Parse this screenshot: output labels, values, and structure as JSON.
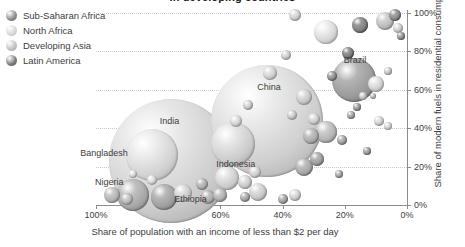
{
  "title": "in developing countries",
  "legend": {
    "position": "top-left",
    "items": [
      {
        "label": "Sub-Saharan Africa",
        "color": "#8d8d8d",
        "icon": "bubble-icon"
      },
      {
        "label": "North Africa",
        "color": "#d8d8d8",
        "icon": "bubble-icon"
      },
      {
        "label": "Developing Asia",
        "color": "#c2c2c2",
        "icon": "bubble-icon"
      },
      {
        "label": "Latin America",
        "color": "#7a7a7a",
        "icon": "bubble-icon"
      }
    ]
  },
  "axes": {
    "x": {
      "label": "Share of population with an income of less than $2 per day",
      "ticks": [
        "100%",
        "80%",
        "60%",
        "40%",
        "20%",
        "0%"
      ],
      "values": [
        100,
        80,
        60,
        40,
        20,
        0
      ],
      "reversed": true
    },
    "y": {
      "label": "Share of modern fuels in residential consumption",
      "ticks": [
        "0%",
        "20%",
        "40%",
        "60%",
        "80%",
        "100%"
      ],
      "values": [
        0,
        20,
        40,
        60,
        80,
        100
      ],
      "side": "right"
    }
  },
  "chart_data": {
    "type": "scatter",
    "title": "in developing countries",
    "xlabel": "Share of population with an income of less than $2 per day",
    "ylabel": "Share of modern fuels in residential consumption",
    "xlim": [
      100,
      0
    ],
    "ylim": [
      0,
      100
    ],
    "x_reversed": true,
    "grid": true,
    "legend_position": "top-left",
    "bubble_encoding": "population",
    "series": [
      {
        "name": "Sub-Saharan Africa",
        "color": "#8d8d8d"
      },
      {
        "name": "North Africa",
        "color": "#d8d8d8"
      },
      {
        "name": "Developing Asia",
        "color": "#c2c2c2"
      },
      {
        "name": "Latin America",
        "color": "#7a7a7a"
      }
    ],
    "points": [
      {
        "label": "India",
        "x": 76,
        "y": 23,
        "size": 62,
        "group": "Developing Asia",
        "color": "#cccccc",
        "label_dx": -1,
        "label_dy": -40
      },
      {
        "label": "Bangladesh",
        "x": 82,
        "y": 26,
        "size": 26,
        "group": "Developing Asia",
        "color": "#d2d2d2",
        "label_dx": -48,
        "label_dy": -2
      },
      {
        "label": "China",
        "x": 45,
        "y": 44,
        "size": 56,
        "group": "Developing Asia",
        "color": "#cfcfcf",
        "label_dx": 2,
        "label_dy": -34
      },
      {
        "label": "Brazil",
        "x": 17,
        "y": 65,
        "size": 22,
        "group": "Latin America",
        "color": "#9a9a9a",
        "label_dx": 1,
        "label_dy": -20
      },
      {
        "label": "Indonesia",
        "x": 56,
        "y": 32,
        "size": 22,
        "group": "Developing Asia",
        "color": "#cbcbcb",
        "label_dx": 3,
        "label_dy": 20
      },
      {
        "label": "Nigeria",
        "x": 88,
        "y": 5,
        "size": 16,
        "group": "Sub-Saharan Africa",
        "color": "#a6a6a6",
        "label_dx": -24,
        "label_dy": -13
      },
      {
        "label": "Ethiopia",
        "x": 78,
        "y": 4,
        "size": 13,
        "group": "Sub-Saharan Africa",
        "color": "#9e9e9e",
        "label_dx": 26,
        "label_dy": 2
      },
      {
        "label": "",
        "x": 95,
        "y": 5,
        "size": 8,
        "group": "Sub-Saharan Africa",
        "color": "#b0b0b0"
      },
      {
        "label": "",
        "x": 90,
        "y": 3,
        "size": 6,
        "group": "Sub-Saharan Africa",
        "color": "#b4b4b4"
      },
      {
        "label": "",
        "x": 72,
        "y": 6,
        "size": 9,
        "group": "Developing Asia",
        "color": "#c6c6c6"
      },
      {
        "label": "",
        "x": 64,
        "y": 4,
        "size": 7,
        "group": "Sub-Saharan Africa",
        "color": "#a8a8a8"
      },
      {
        "label": "",
        "x": 60,
        "y": 5,
        "size": 7,
        "group": "Sub-Saharan Africa",
        "color": "#adadad"
      },
      {
        "label": "",
        "x": 52,
        "y": 4,
        "size": 5,
        "group": "Sub-Saharan Africa",
        "color": "#a3a3a3"
      },
      {
        "label": "",
        "x": 48,
        "y": 7,
        "size": 9,
        "group": "Developing Asia",
        "color": "#c4c4c4"
      },
      {
        "label": "",
        "x": 40,
        "y": 3,
        "size": 5,
        "group": "Sub-Saharan Africa",
        "color": "#a0a0a0"
      },
      {
        "label": "",
        "x": 36,
        "y": 5,
        "size": 6,
        "group": "Developing Asia",
        "color": "#c8c8c8"
      },
      {
        "label": "",
        "x": 58,
        "y": 14,
        "size": 12,
        "group": "Developing Asia",
        "color": "#cacaca"
      },
      {
        "label": "",
        "x": 52,
        "y": 12,
        "size": 7,
        "group": "Developing Asia",
        "color": "#c5c5c5"
      },
      {
        "label": "",
        "x": 66,
        "y": 11,
        "size": 6,
        "group": "Sub-Saharan Africa",
        "color": "#aaaaaa"
      },
      {
        "label": "",
        "x": 33,
        "y": 20,
        "size": 9,
        "group": "Latin America",
        "color": "#a5a5a5"
      },
      {
        "label": "",
        "x": 29,
        "y": 24,
        "size": 7,
        "group": "Latin America",
        "color": "#9c9c9c"
      },
      {
        "label": "",
        "x": 26,
        "y": 38,
        "size": 11,
        "group": "Latin America",
        "color": "#b3b3b3"
      },
      {
        "label": "",
        "x": 31,
        "y": 36,
        "size": 8,
        "group": "Latin America",
        "color": "#a9a9a9"
      },
      {
        "label": "",
        "x": 21,
        "y": 34,
        "size": 5,
        "group": "Latin America",
        "color": "#9f9f9f"
      },
      {
        "label": "",
        "x": 18,
        "y": 47,
        "size": 4,
        "group": "Latin America",
        "color": "#a1a1a1"
      },
      {
        "label": "",
        "x": 16,
        "y": 51,
        "size": 4,
        "group": "Latin America",
        "color": "#999999"
      },
      {
        "label": "",
        "x": 14,
        "y": 57,
        "size": 4,
        "group": "North Africa",
        "color": "#c0c0c0"
      },
      {
        "label": "",
        "x": 11,
        "y": 57,
        "size": 3,
        "group": "North Africa",
        "color": "#bdbdbd"
      },
      {
        "label": "",
        "x": 10,
        "y": 63,
        "size": 8,
        "group": "North Africa",
        "color": "#cdcdcd"
      },
      {
        "label": "",
        "x": 33,
        "y": 56,
        "size": 8,
        "group": "Developing Asia",
        "color": "#c3c3c3"
      },
      {
        "label": "",
        "x": 24,
        "y": 67,
        "size": 5,
        "group": "Latin America",
        "color": "#8f8f8f"
      },
      {
        "label": "",
        "x": 19,
        "y": 79,
        "size": 6,
        "group": "Latin America",
        "color": "#7d7d7d"
      },
      {
        "label": "",
        "x": 26,
        "y": 90,
        "size": 12,
        "group": "North Africa",
        "color": "#d4d4d4"
      },
      {
        "label": "",
        "x": 15,
        "y": 94,
        "size": 8,
        "group": "Latin America",
        "color": "#7f7f7f"
      },
      {
        "label": "",
        "x": 7,
        "y": 96,
        "size": 9,
        "group": "North Africa",
        "color": "#b8b8b8"
      },
      {
        "label": "",
        "x": 4,
        "y": 99,
        "size": 6,
        "group": "Latin America",
        "color": "#8a8a8a"
      },
      {
        "label": "",
        "x": 3,
        "y": 92,
        "size": 5,
        "group": "North Africa",
        "color": "#c7c7c7"
      },
      {
        "label": "",
        "x": 2,
        "y": 88,
        "size": 4,
        "group": "Latin America",
        "color": "#959595"
      },
      {
        "label": "",
        "x": 6,
        "y": 70,
        "size": 4,
        "group": "North Africa",
        "color": "#c1c1c1"
      },
      {
        "label": "",
        "x": 9,
        "y": 44,
        "size": 5,
        "group": "Developing Asia",
        "color": "#c9c9c9"
      },
      {
        "label": "",
        "x": 6,
        "y": 41,
        "size": 4,
        "group": "Developing Asia",
        "color": "#cbcbcb"
      },
      {
        "label": "",
        "x": 30,
        "y": 45,
        "size": 6,
        "group": "Developing Asia",
        "color": "#c6c6c6"
      },
      {
        "label": "",
        "x": 37,
        "y": 47,
        "size": 5,
        "group": "Developing Asia",
        "color": "#c2c2c2"
      },
      {
        "label": "",
        "x": 44,
        "y": 69,
        "size": 7,
        "group": "Developing Asia",
        "color": "#cacaca"
      },
      {
        "label": "",
        "x": 39,
        "y": 78,
        "size": 5,
        "group": "Developing Asia",
        "color": "#c5c5c5"
      },
      {
        "label": "",
        "x": 36,
        "y": 99,
        "size": 6,
        "group": "Developing Asia",
        "color": "#c8c8c8"
      },
      {
        "label": "",
        "x": 49,
        "y": 17,
        "size": 6,
        "group": "Developing Asia",
        "color": "#c7c7c7"
      },
      {
        "label": "",
        "x": 22,
        "y": 16,
        "size": 4,
        "group": "Latin America",
        "color": "#a4a4a4"
      },
      {
        "label": "",
        "x": 13,
        "y": 28,
        "size": 4,
        "group": "Latin America",
        "color": "#9b9b9b"
      },
      {
        "label": "",
        "x": 55,
        "y": 44,
        "size": 6,
        "group": "Developing Asia",
        "color": "#cccccc"
      },
      {
        "label": "",
        "x": 51,
        "y": 52,
        "size": 5,
        "group": "Developing Asia",
        "color": "#c4c4c4"
      },
      {
        "label": "",
        "x": 82,
        "y": 13,
        "size": 5,
        "group": "Developing Asia",
        "color": "#cecece"
      },
      {
        "label": "",
        "x": 88,
        "y": 16,
        "size": 4,
        "group": "Developing Asia",
        "color": "#d0d0d0"
      }
    ]
  }
}
